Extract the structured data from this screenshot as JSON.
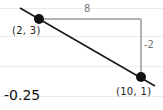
{
  "diagram": {
    "type": "slope-of-line",
    "points": [
      {
        "label": "(2, 3)",
        "x": 2,
        "y": 3
      },
      {
        "label": "(10, 1)",
        "x": 10,
        "y": 1
      }
    ],
    "run_label": "8",
    "rise_label": "-2",
    "slope_label": "-0.25",
    "colors": {
      "line": "#1a1a1a",
      "triangle": "#9a9a9a",
      "point": "#111111",
      "rules": "#ececec"
    }
  }
}
